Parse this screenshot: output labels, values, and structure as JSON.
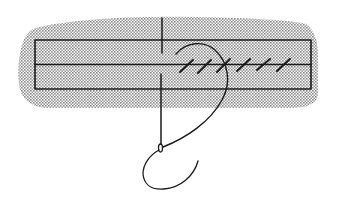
{
  "title": "",
  "diagram": {
    "colors": {
      "ink": "#1a1a1a",
      "shade": "#b9b9b9",
      "background": "#ffffff"
    },
    "stitch_count": 6,
    "elements": [
      "fabric-shading",
      "fabric-rectangle",
      "center-seam-line",
      "needle",
      "thread-arc",
      "slant-stitches",
      "thread-loop"
    ]
  }
}
